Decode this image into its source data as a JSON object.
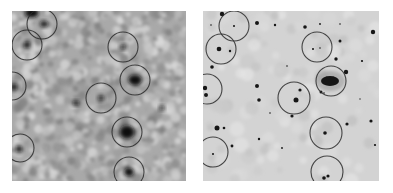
{
  "figure": {
    "panels": [
      {
        "id": "left",
        "description": "noisy grayscale sky image with circled sources",
        "x": 12,
        "y": 11,
        "width": 174,
        "height": 170,
        "background": "#a9a9a9",
        "circles": [
          {
            "cx": 30,
            "cy": 13,
            "r": 15
          },
          {
            "cx": 15,
            "cy": 34,
            "r": 15
          },
          {
            "cx": 111,
            "cy": 36,
            "r": 15
          },
          {
            "cx": 123,
            "cy": 69,
            "r": 15
          },
          {
            "cx": 89,
            "cy": 87,
            "r": 15
          },
          {
            "cx": 0,
            "cy": 75,
            "r": 14
          },
          {
            "cx": 115,
            "cy": 121,
            "r": 15
          },
          {
            "cx": 8,
            "cy": 137,
            "r": 14
          },
          {
            "cx": 117,
            "cy": 161,
            "r": 15
          }
        ],
        "sources": [
          {
            "cx": 20,
            "cy": 2,
            "rx": 6,
            "ry": 4
          },
          {
            "cx": 32,
            "cy": 13,
            "rx": 3,
            "ry": 2
          },
          {
            "cx": 15,
            "cy": 34,
            "rx": 2.5,
            "ry": 2.5
          },
          {
            "cx": 111,
            "cy": 36,
            "rx": 2,
            "ry": 1.5
          },
          {
            "cx": 123,
            "cy": 69,
            "rx": 6,
            "ry": 4.5
          },
          {
            "cx": 89,
            "cy": 87,
            "rx": 2,
            "ry": 1.8
          },
          {
            "cx": 2,
            "cy": 76,
            "rx": 2.5,
            "ry": 2.5
          },
          {
            "cx": 115,
            "cy": 121,
            "rx": 6.5,
            "ry": 6
          },
          {
            "cx": 7,
            "cy": 138,
            "rx": 2.5,
            "ry": 2.5
          },
          {
            "cx": 117,
            "cy": 161,
            "rx": 4,
            "ry": 3.5
          },
          {
            "cx": 64,
            "cy": 92,
            "rx": 3,
            "ry": 1.5
          },
          {
            "cx": 150,
            "cy": 97,
            "rx": 1.5,
            "ry": 1.5
          }
        ]
      },
      {
        "id": "right",
        "description": "clean grayscale sky image with stars, galaxy and circled sources",
        "x": 203,
        "y": 11,
        "width": 176,
        "height": 170,
        "background": "#d3d3d3",
        "circles": [
          {
            "cx": 31,
            "cy": 15,
            "r": 15
          },
          {
            "cx": 18,
            "cy": 38,
            "r": 15
          },
          {
            "cx": 114,
            "cy": 36,
            "r": 15
          },
          {
            "cx": 128,
            "cy": 70,
            "r": 15
          },
          {
            "cx": 91,
            "cy": 87,
            "r": 16
          },
          {
            "cx": 4,
            "cy": 78,
            "r": 15
          },
          {
            "cx": 123,
            "cy": 122,
            "r": 16
          },
          {
            "cx": 10,
            "cy": 141,
            "r": 15
          },
          {
            "cx": 124,
            "cy": 161,
            "r": 16
          }
        ],
        "stars": [
          {
            "cx": 19,
            "cy": 3,
            "r": 2.2
          },
          {
            "cx": 31,
            "cy": 15,
            "r": 1
          },
          {
            "cx": 8,
            "cy": 14,
            "r": 0.8
          },
          {
            "cx": 16,
            "cy": 38,
            "r": 2.3
          },
          {
            "cx": 9,
            "cy": 56,
            "r": 1.8
          },
          {
            "cx": 2,
            "cy": 77,
            "r": 2.2
          },
          {
            "cx": 3,
            "cy": 84,
            "r": 2
          },
          {
            "cx": 54,
            "cy": 12,
            "r": 2
          },
          {
            "cx": 72,
            "cy": 14,
            "r": 1.2
          },
          {
            "cx": 102,
            "cy": 16,
            "r": 1.8
          },
          {
            "cx": 117,
            "cy": 13,
            "r": 0.9
          },
          {
            "cx": 137,
            "cy": 13,
            "r": 0.8
          },
          {
            "cx": 170,
            "cy": 21,
            "r": 2.2
          },
          {
            "cx": 110,
            "cy": 38,
            "r": 1
          },
          {
            "cx": 117,
            "cy": 37,
            "r": 0.8
          },
          {
            "cx": 137,
            "cy": 30,
            "r": 1.5
          },
          {
            "cx": 133,
            "cy": 48,
            "r": 1.7
          },
          {
            "cx": 159,
            "cy": 50,
            "r": 1.1
          },
          {
            "cx": 143,
            "cy": 61,
            "r": 2.2
          },
          {
            "cx": 118,
            "cy": 81,
            "r": 1.5
          },
          {
            "cx": 121,
            "cy": 82,
            "r": 0.8
          },
          {
            "cx": 27,
            "cy": 40,
            "r": 1.2
          },
          {
            "cx": 54,
            "cy": 75,
            "r": 2
          },
          {
            "cx": 56,
            "cy": 89,
            "r": 1.8
          },
          {
            "cx": 93,
            "cy": 89,
            "r": 2.5
          },
          {
            "cx": 97,
            "cy": 79,
            "r": 1.6
          },
          {
            "cx": 89,
            "cy": 105,
            "r": 1.6
          },
          {
            "cx": 14,
            "cy": 117,
            "r": 2.5
          },
          {
            "cx": 21,
            "cy": 117,
            "r": 1.3
          },
          {
            "cx": 29,
            "cy": 135,
            "r": 1.4
          },
          {
            "cx": 10,
            "cy": 143,
            "r": 1
          },
          {
            "cx": 56,
            "cy": 128,
            "r": 1.2
          },
          {
            "cx": 79,
            "cy": 137,
            "r": 0.9
          },
          {
            "cx": 122,
            "cy": 122,
            "r": 1.8
          },
          {
            "cx": 144,
            "cy": 113,
            "r": 1.6
          },
          {
            "cx": 168,
            "cy": 110,
            "r": 1.6
          },
          {
            "cx": 172,
            "cy": 134,
            "r": 1.1
          },
          {
            "cx": 121,
            "cy": 167,
            "r": 1.8
          },
          {
            "cx": 125,
            "cy": 165,
            "r": 1.6
          },
          {
            "cx": 67,
            "cy": 102,
            "r": 0.8
          },
          {
            "cx": 84,
            "cy": 55,
            "r": 0.8
          },
          {
            "cx": 157,
            "cy": 88,
            "r": 0.7
          }
        ],
        "galaxy": {
          "cx": 127,
          "cy": 70,
          "rx": 9,
          "ry": 5
        }
      }
    ]
  }
}
